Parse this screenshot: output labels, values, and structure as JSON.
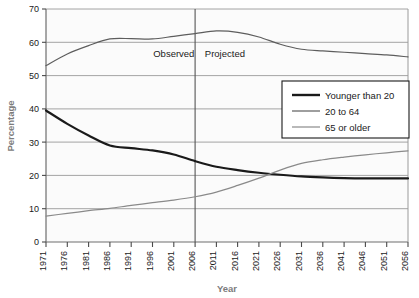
{
  "chart_data": {
    "type": "line",
    "title": "",
    "xlabel": "Year",
    "ylabel": "Percentage",
    "ylim": [
      0,
      70
    ],
    "y_ticks": [
      0,
      10,
      20,
      30,
      40,
      50,
      60,
      70
    ],
    "grid": true,
    "legend_position": "right-upper-inside",
    "x": [
      1971,
      1976,
      1981,
      1986,
      1991,
      1996,
      2001,
      2006,
      2011,
      2016,
      2021,
      2026,
      2031,
      2036,
      2041,
      2046,
      2051,
      2056
    ],
    "x_tick_labels": [
      "1971",
      "1976",
      "1981",
      "1986",
      "1991",
      "1996",
      "2001",
      "2006",
      "2011",
      "2016",
      "2021",
      "2026",
      "2031",
      "2036",
      "2041",
      "2046",
      "2051",
      "2056"
    ],
    "series": [
      {
        "name": "Younger than 20",
        "color": "#1a1a1a",
        "width": 2.2,
        "values": [
          39.5,
          35.5,
          32.0,
          29.0,
          28.2,
          27.5,
          26.3,
          24.3,
          22.6,
          21.6,
          20.8,
          20.2,
          19.7,
          19.4,
          19.2,
          19.1,
          19.1,
          19.1
        ]
      },
      {
        "name": "20 to 64",
        "color": "#5d5d5d",
        "width": 1.2,
        "values": [
          53.0,
          56.5,
          59.0,
          61.0,
          61.1,
          61.0,
          61.8,
          62.6,
          63.4,
          63.0,
          61.6,
          59.4,
          57.9,
          57.4,
          57.0,
          56.6,
          56.2,
          55.6
        ]
      },
      {
        "name": "65 or older",
        "color": "#8a8a8a",
        "width": 1.2,
        "values": [
          7.8,
          8.6,
          9.4,
          10.1,
          11.0,
          11.8,
          12.6,
          13.6,
          15.0,
          17.0,
          19.2,
          21.6,
          23.6,
          24.7,
          25.5,
          26.2,
          26.8,
          27.4
        ]
      }
    ],
    "annotations": [
      {
        "text": "Observed",
        "x_value": 2001,
        "y_value": 55.5
      },
      {
        "text": "Projected",
        "x_value": 2013,
        "y_value": 55.5
      }
    ],
    "divider": {
      "x_value": 2006,
      "label": ""
    }
  },
  "legend": {
    "items": [
      {
        "label": "Younger than 20",
        "color": "#1a1a1a"
      },
      {
        "label": "20 to 64",
        "color": "#5d5d5d"
      },
      {
        "label": "65 or older",
        "color": "#8a8a8a"
      }
    ]
  }
}
